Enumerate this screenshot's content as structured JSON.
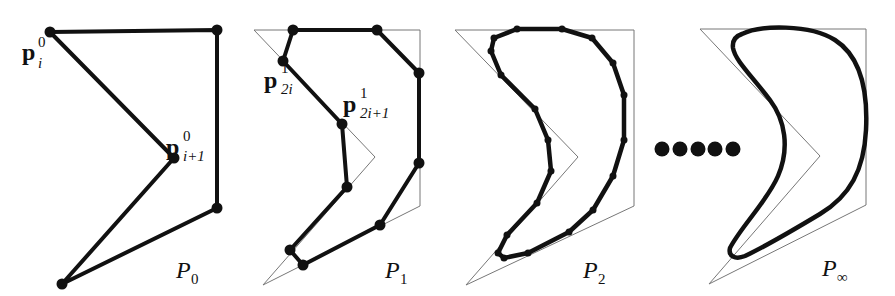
{
  "figure": {
    "stroke_color": "#111111",
    "guide_color": "#777777",
    "panels": [
      {
        "id": "P0",
        "label_main": "P",
        "label_sub": "0",
        "points": [
          [
            50,
            32
          ],
          [
            217,
            30
          ],
          [
            217,
            208
          ],
          [
            62,
            284
          ],
          [
            174,
            158
          ]
        ],
        "annotations": [
          {
            "main": "p",
            "sup": "0",
            "sub": "i",
            "x": 18,
            "y": 60
          },
          {
            "main": "p",
            "sup": "0",
            "sub": "i+1",
            "x": 166,
            "y": 150
          }
        ]
      },
      {
        "id": "P1",
        "label_main": "P",
        "label_sub": "1",
        "guide": [
          [
            254,
            30
          ],
          [
            420,
            30
          ],
          [
            420,
            206
          ],
          [
            263,
            285
          ],
          [
            375,
            157
          ]
        ],
        "points": [
          [
            293,
            30
          ],
          [
            377,
            30
          ],
          [
            419,
            73
          ],
          [
            419,
            163
          ],
          [
            380,
            225
          ],
          [
            303,
            265
          ],
          [
            290,
            250
          ],
          [
            347,
            187
          ],
          [
            342,
            124
          ],
          [
            283,
            61
          ]
        ],
        "annotations": [
          {
            "main": "p",
            "sup": "1",
            "sub": "2i",
            "x": 262,
            "y": 85
          },
          {
            "main": "p",
            "sup": "1",
            "sub": "2i+1",
            "x": 342,
            "y": 113
          }
        ]
      },
      {
        "id": "P2",
        "label_main": "P",
        "label_sub": "2",
        "guide": [
          [
            455,
            30
          ],
          [
            634,
            30
          ],
          [
            634,
            206
          ],
          [
            466,
            285
          ],
          [
            578,
            157
          ]
        ],
        "points": [
          [
            517,
            29
          ],
          [
            562,
            29
          ],
          [
            592,
            38
          ],
          [
            613,
            63
          ],
          [
            624,
            95
          ],
          [
            624,
            140
          ],
          [
            613,
            176
          ],
          [
            593,
            210
          ],
          [
            569,
            232
          ],
          [
            528,
            253
          ],
          [
            504,
            258
          ],
          [
            498,
            253
          ],
          [
            507,
            235
          ],
          [
            537,
            203
          ],
          [
            551,
            171
          ],
          [
            548,
            140
          ],
          [
            535,
            109
          ],
          [
            501,
            75
          ],
          [
            491,
            51
          ],
          [
            494,
            38
          ]
        ]
      },
      {
        "id": "Pinf",
        "label_main": "P",
        "label_sub": "∞",
        "guide": [
          [
            700,
            29
          ],
          [
            866,
            29
          ],
          [
            866,
            205
          ],
          [
            709,
            284
          ],
          [
            820,
            156
          ]
        ]
      }
    ],
    "ellipsis_dots": [
      [
        662,
        149
      ],
      [
        680,
        149
      ],
      [
        698,
        149
      ],
      [
        715,
        149
      ],
      [
        733,
        149
      ]
    ]
  }
}
